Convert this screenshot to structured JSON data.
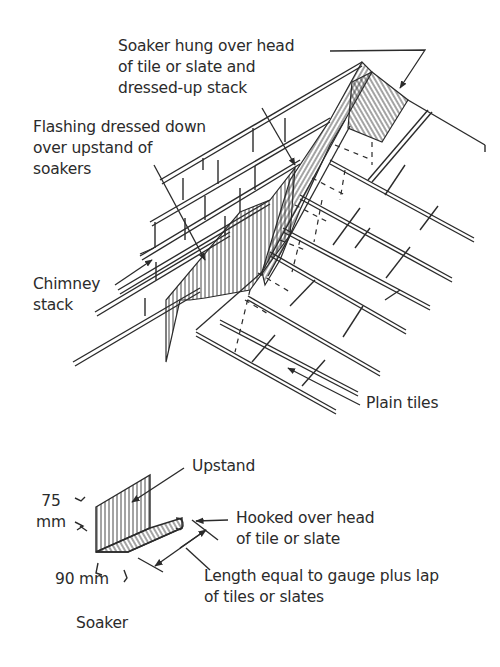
{
  "diagram": {
    "main_view": {
      "labels": {
        "soaker_hung": [
          "Soaker hung over head",
          "of tile or slate and",
          "dressed-up stack"
        ],
        "flashing": [
          "Flashing dressed down",
          "over upstand of",
          "soakers"
        ],
        "chimney": [
          "Chimney",
          "stack"
        ],
        "plain_tiles": [
          "Plain tiles"
        ]
      }
    },
    "soaker_detail": {
      "title": "Soaker",
      "labels": {
        "upstand": [
          "Upstand"
        ],
        "hooked": [
          "Hooked over head",
          "of tile or slate"
        ],
        "length": [
          "Length equal to gauge plus lap",
          "of tiles or slates"
        ]
      },
      "dimensions": {
        "height_value": "75",
        "height_unit": "mm",
        "width": "90 mm"
      }
    },
    "colors": {
      "ink": "#2b2b2b",
      "paper": "#ffffff"
    }
  }
}
